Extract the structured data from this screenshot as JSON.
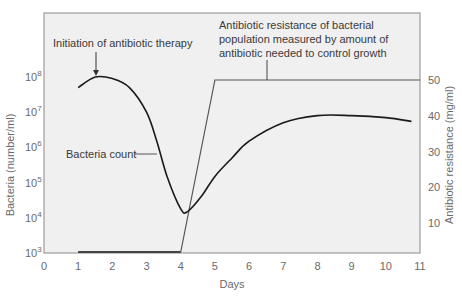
{
  "chart_data": {
    "type": "line",
    "title": "",
    "xlabel": "Days",
    "ylabel": "Bacteria (number/ml)",
    "ylabel_right": "Antibiotic resistance (mg/ml)",
    "xlim": [
      0,
      11
    ],
    "ylim": [
      1000,
      100000000
    ],
    "ylim_right": [
      0,
      50
    ],
    "yscale": "log",
    "grid": false,
    "x_ticks": [
      "0",
      "1",
      "2",
      "3",
      "4",
      "5",
      "6",
      "7",
      "8",
      "9",
      "10",
      "11"
    ],
    "y_ticks_left": [
      {
        "base": "10",
        "exp": "3"
      },
      {
        "base": "10",
        "exp": "4"
      },
      {
        "base": "10",
        "exp": "5"
      },
      {
        "base": "10",
        "exp": "6"
      },
      {
        "base": "10",
        "exp": "7"
      },
      {
        "base": "10",
        "exp": "8"
      }
    ],
    "y_ticks_right": [
      "10",
      "20",
      "30",
      "40",
      "50"
    ],
    "series": [
      {
        "name": "Bacteria count",
        "axis": "left",
        "x": [
          1.0,
          1.5,
          2.0,
          2.5,
          3.0,
          3.3,
          3.6,
          4.0,
          4.2,
          4.6,
          5.0,
          5.5,
          6.0,
          7.0,
          8.0,
          9.0,
          10.0,
          10.75
        ],
        "values": [
          50000000,
          100000000,
          90000000,
          50000000,
          10000000,
          1500000,
          150000,
          18000,
          15000,
          40000,
          150000,
          500000,
          1500000,
          5000000,
          8000000,
          8000000,
          7000000,
          5500000
        ]
      },
      {
        "name": "Antibiotic resistance",
        "axis": "right",
        "x": [
          1,
          4,
          5,
          11
        ],
        "values": [
          0,
          0,
          50,
          50
        ]
      }
    ],
    "annotations": [
      {
        "text": "Initiation of antibiotic therapy",
        "x": 1.5,
        "target": "bacteria peak"
      },
      {
        "text": "Bacteria count",
        "target": "bacteria curve"
      },
      {
        "lines": [
          "Antibiotic resistance of bacterial",
          "population measured by amount of",
          "antibiotic needed to control growth"
        ],
        "target": "resistance line"
      }
    ]
  }
}
